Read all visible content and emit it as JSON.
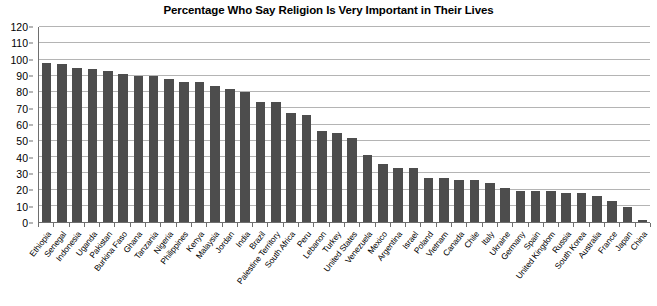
{
  "chart": {
    "title": "Percentage Who Say Religion Is Very Important in Their Lives"
  },
  "chart_data": {
    "type": "bar",
    "title": "Percentage Who Say Religion Is Very Important in Their Lives",
    "xlabel": "",
    "ylabel": "",
    "ylim": [
      0,
      120
    ],
    "yticks": [
      0,
      10,
      20,
      30,
      40,
      50,
      60,
      70,
      80,
      90,
      100,
      110,
      120
    ],
    "grid": true,
    "legend": false,
    "bar_color": "#4d4d4d",
    "grid_color": "#b4b4b4",
    "axis_color": "#6e6e6e",
    "categories": [
      "Ethiopia",
      "Senegal",
      "Indonesia",
      "Uganda",
      "Pakistan",
      "Burkina Faso",
      "Ghana",
      "Tanzania",
      "Nigeria",
      "Philippines",
      "Kenya",
      "Malaysia",
      "Jordan",
      "India",
      "Brazil",
      "Palestine Territory",
      "South Africa",
      "Peru",
      "Lebanon",
      "Turkey",
      "United States",
      "Venezuela",
      "Mexico",
      "Argentina",
      "Israel",
      "Poland",
      "Vietnam",
      "Canada",
      "Chile",
      "Italy",
      "Ukraine",
      "Germany",
      "Spain",
      "United Kingdom",
      "Russia",
      "South Korea",
      "Australia",
      "France",
      "Japan",
      "China"
    ],
    "values": [
      98,
      97,
      95,
      94,
      93,
      91,
      90,
      90,
      88,
      86,
      86,
      84,
      82,
      80,
      74,
      74,
      67,
      66,
      56,
      55,
      52,
      41,
      36,
      33,
      33,
      27,
      27,
      26,
      26,
      24,
      21,
      19,
      19,
      19,
      18,
      18,
      16,
      13,
      9,
      1
    ]
  }
}
